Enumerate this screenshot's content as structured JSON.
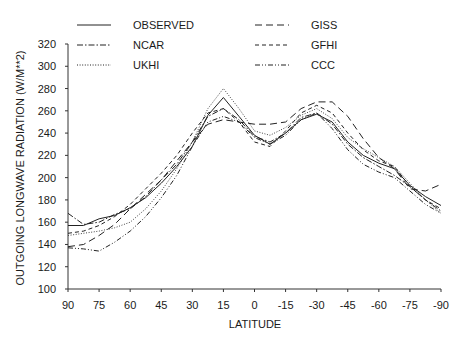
{
  "chart_data": {
    "type": "line",
    "title": "",
    "xlabel": "LATITUDE",
    "ylabel": "OUTGOING LONGWAVE RADIATION (W/M**2)",
    "xlim": [
      90,
      -90
    ],
    "ylim": [
      100,
      320
    ],
    "x_ticks": [
      90,
      75,
      60,
      45,
      30,
      15,
      0,
      -15,
      -30,
      -45,
      -60,
      -75,
      -90
    ],
    "x_tick_labels": [
      "90",
      "75",
      "60",
      "45",
      "30",
      "15",
      "0",
      "-15",
      "-30",
      "-45",
      "-60",
      "-75",
      "-90"
    ],
    "y_ticks": [
      100,
      120,
      140,
      160,
      180,
      200,
      220,
      240,
      260,
      280,
      300,
      320
    ],
    "y_tick_labels": [
      "100",
      "120",
      "140",
      "160",
      "180",
      "200",
      "220",
      "240",
      "260",
      "280",
      "300",
      "320"
    ],
    "grid": false,
    "legend_position": "top",
    "x": [
      90,
      82.5,
      75,
      67.5,
      60,
      52.5,
      45,
      37.5,
      30,
      22.5,
      15,
      7.5,
      0,
      -7.5,
      -15,
      -22.5,
      -30,
      -37.5,
      -45,
      -52.5,
      -60,
      -67.5,
      -75,
      -82.5,
      -90
    ],
    "series": [
      {
        "name": "OBSERVED",
        "style": "solid",
        "values": [
          157,
          157,
          163,
          166,
          173,
          182,
          195,
          210,
          228,
          256,
          272,
          255,
          238,
          230,
          240,
          252,
          257,
          250,
          232,
          220,
          213,
          208,
          193,
          183,
          175
        ]
      },
      {
        "name": "NCAR",
        "style": "dashdot",
        "values": [
          168,
          158,
          160,
          167,
          172,
          183,
          198,
          212,
          232,
          255,
          262,
          252,
          237,
          232,
          240,
          254,
          258,
          248,
          230,
          218,
          210,
          202,
          192,
          180,
          170
        ]
      },
      {
        "name": "UKHI",
        "style": "dotted",
        "values": [
          148,
          150,
          152,
          155,
          160,
          172,
          188,
          208,
          232,
          262,
          280,
          262,
          242,
          238,
          245,
          256,
          262,
          253,
          236,
          226,
          218,
          210,
          195,
          180,
          168
        ]
      },
      {
        "name": "GISS",
        "style": "longdash",
        "values": [
          138,
          140,
          148,
          158,
          172,
          185,
          198,
          215,
          232,
          248,
          252,
          250,
          248,
          248,
          250,
          262,
          268,
          268,
          255,
          235,
          218,
          208,
          190,
          188,
          194
        ]
      },
      {
        "name": "GFHI",
        "style": "dash",
        "values": [
          150,
          152,
          157,
          165,
          176,
          190,
          204,
          220,
          240,
          258,
          262,
          250,
          232,
          228,
          242,
          258,
          265,
          258,
          240,
          225,
          215,
          210,
          192,
          180,
          172
        ]
      },
      {
        "name": "CCC",
        "style": "dashdotdot",
        "values": [
          137,
          136,
          134,
          142,
          152,
          165,
          182,
          202,
          228,
          250,
          255,
          250,
          236,
          230,
          238,
          252,
          258,
          244,
          225,
          212,
          205,
          200,
          188,
          176,
          168
        ]
      }
    ]
  },
  "legend": [
    {
      "label": "OBSERVED",
      "col": 0,
      "row": 0
    },
    {
      "label": "NCAR",
      "col": 0,
      "row": 1
    },
    {
      "label": "UKHI",
      "col": 0,
      "row": 2
    },
    {
      "label": "GISS",
      "col": 1,
      "row": 0
    },
    {
      "label": "GFHI",
      "col": 1,
      "row": 1
    },
    {
      "label": "CCC",
      "col": 1,
      "row": 2
    }
  ]
}
